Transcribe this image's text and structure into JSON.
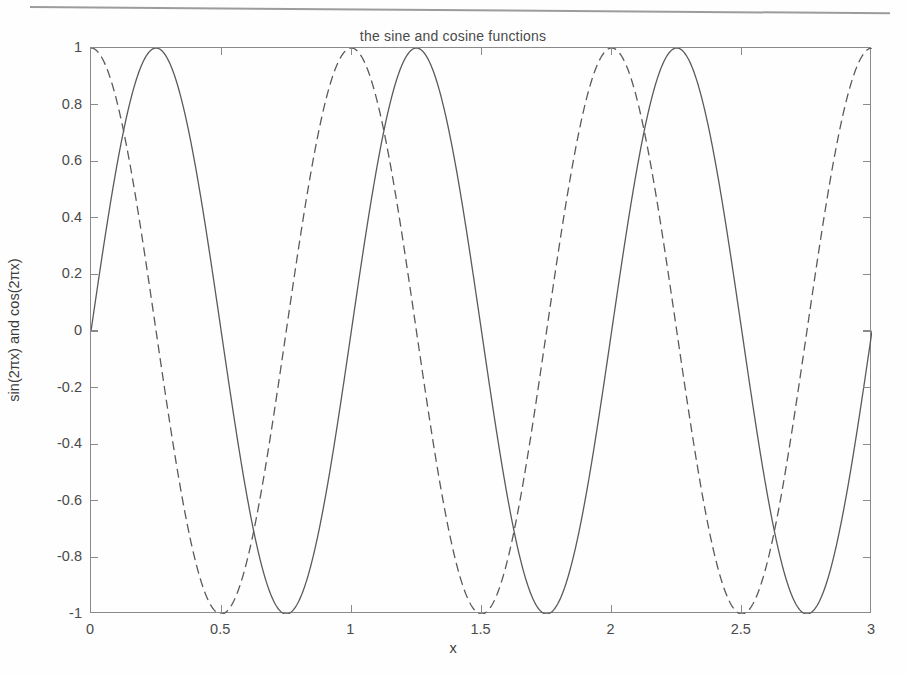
{
  "figure": {
    "title": "the sine and cosine functions",
    "x_axis_title": "x",
    "y_axis_title": "sin(2πx) and cos(2πx)"
  },
  "chart_data": {
    "type": "line",
    "title": "the sine and cosine functions",
    "xlabel": "x",
    "ylabel": "sin(2πx) and cos(2πx)",
    "xlim": [
      0,
      3
    ],
    "ylim": [
      -1,
      1
    ],
    "grid": false,
    "legend": null,
    "xticks": [
      0,
      0.5,
      1,
      1.5,
      2,
      2.5,
      3
    ],
    "xticklabels": [
      "0",
      "0.5",
      "1",
      "1.5",
      "2",
      "2.5",
      "3"
    ],
    "yticks": [
      1,
      0.8,
      0.6,
      0.4,
      0.2,
      0,
      -0.2,
      -0.4,
      -0.6,
      -0.8,
      -1
    ],
    "yticklabels": [
      "1",
      "0.8",
      "0.6",
      "0.4",
      "0.2",
      "0",
      "-0.2",
      "-0.4",
      "-0.6",
      "-0.8",
      "-1"
    ],
    "series": [
      {
        "name": "sin(2πx)",
        "expression": "sin(2*pi*x)",
        "linestyle": "solid",
        "color": "#5a5a5a",
        "linewidth": 1.3,
        "amplitude": 1,
        "period": 1,
        "phase": 0,
        "x_start": 0,
        "x_end": 3,
        "maxima_x": [
          0.25,
          1.25,
          2.25
        ],
        "minima_x": [
          0.75,
          1.75,
          2.75
        ],
        "zero_crossings_x": [
          0,
          0.5,
          1,
          1.5,
          2,
          2.5,
          3
        ]
      },
      {
        "name": "cos(2πx)",
        "expression": "cos(2*pi*x)",
        "linestyle": "dashed",
        "color": "#5a5a5a",
        "linewidth": 1.3,
        "dash_pattern": [
          9,
          5
        ],
        "amplitude": 1,
        "period": 1,
        "phase": 1.5707963267948966,
        "x_start": 0,
        "x_end": 3,
        "maxima_x": [
          0,
          1,
          2,
          3
        ],
        "minima_x": [
          0.5,
          1.5,
          2.5
        ],
        "zero_crossings_x": [
          0.25,
          0.75,
          1.25,
          1.75,
          2.25,
          2.75
        ]
      }
    ]
  },
  "style": {
    "axis_color": "#8a8a8a",
    "text_color": "#4a4a4a",
    "background": "#fefefe",
    "line_color": "#5a5a5a"
  }
}
